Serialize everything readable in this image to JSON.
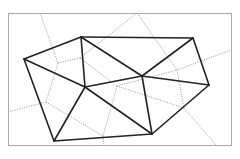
{
  "diagram": {
    "type": "delaunay-voronoi",
    "frame": {
      "x": 8,
      "y": 13,
      "width": 223,
      "height": 132
    },
    "sites": [
      {
        "id": "A",
        "x": 24,
        "y": 59
      },
      {
        "id": "B",
        "x": 81,
        "y": 37
      },
      {
        "id": "C",
        "x": 193,
        "y": 38
      },
      {
        "id": "D",
        "x": 209,
        "y": 85
      },
      {
        "id": "E",
        "x": 54,
        "y": 141
      },
      {
        "id": "F",
        "x": 152,
        "y": 134
      },
      {
        "id": "G",
        "x": 85,
        "y": 87
      },
      {
        "id": "H",
        "x": 142,
        "y": 76
      }
    ],
    "delaunay_edges": [
      [
        "A",
        "B"
      ],
      [
        "B",
        "C"
      ],
      [
        "C",
        "D"
      ],
      [
        "D",
        "F"
      ],
      [
        "F",
        "E"
      ],
      [
        "E",
        "A"
      ],
      [
        "A",
        "G"
      ],
      [
        "B",
        "G"
      ],
      [
        "B",
        "H"
      ],
      [
        "C",
        "H"
      ],
      [
        "H",
        "D"
      ],
      [
        "H",
        "F"
      ],
      [
        "G",
        "H"
      ],
      [
        "G",
        "E"
      ],
      [
        "G",
        "F"
      ]
    ],
    "voronoi_edges": [
      {
        "x1": 40,
        "y1": 13,
        "x2": 58,
        "y2": 63
      },
      {
        "x1": 58,
        "y1": 63,
        "x2": 80,
        "y2": 58
      },
      {
        "x1": 80,
        "y1": 58,
        "x2": 137,
        "y2": 13
      },
      {
        "x1": 80,
        "y1": 58,
        "x2": 117,
        "y2": 86
      },
      {
        "x1": 58,
        "y1": 63,
        "x2": 46,
        "y2": 102
      },
      {
        "x1": 46,
        "y1": 102,
        "x2": 8,
        "y2": 112
      },
      {
        "x1": 46,
        "y1": 102,
        "x2": 103,
        "y2": 136
      },
      {
        "x1": 117,
        "y1": 86,
        "x2": 103,
        "y2": 136
      },
      {
        "x1": 103,
        "y1": 136,
        "x2": 104,
        "y2": 145
      },
      {
        "x1": 117,
        "y1": 86,
        "x2": 177,
        "y2": 70
      },
      {
        "x1": 137,
        "y1": 13,
        "x2": 177,
        "y2": 70
      },
      {
        "x1": 177,
        "y1": 70,
        "x2": 231,
        "y2": 50
      },
      {
        "x1": 177,
        "y1": 70,
        "x2": 184,
        "y2": 108
      },
      {
        "x1": 184,
        "y1": 108,
        "x2": 216,
        "y2": 145
      },
      {
        "x1": 184,
        "y1": 108,
        "x2": 117,
        "y2": 86
      }
    ]
  }
}
